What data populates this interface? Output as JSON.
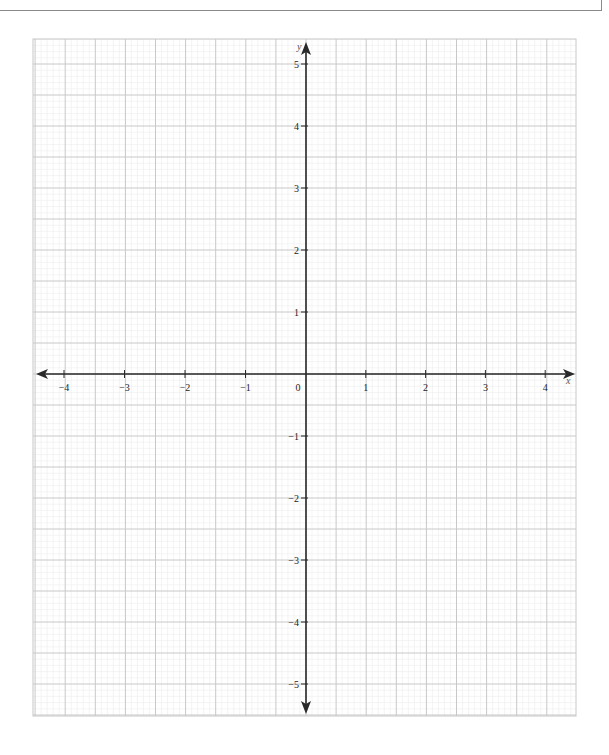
{
  "chart_data": {
    "type": "scatter",
    "title": "",
    "subtitle": "",
    "xlabel": "x",
    "ylabel": "y",
    "xlim": [
      -4.55,
      4.5
    ],
    "ylim": [
      -5.5,
      5.55
    ],
    "x_ticks": [
      -4,
      -3,
      -2,
      -1,
      0,
      1,
      2,
      3,
      4
    ],
    "x_tick_labels": [
      "−4",
      "−3",
      "−2",
      "−1",
      "0",
      "1",
      "2",
      "3",
      "4"
    ],
    "y_ticks": [
      5,
      4,
      3,
      2,
      1,
      -1,
      -2,
      -3,
      -4,
      -5
    ],
    "y_tick_labels": [
      "5",
      "4",
      "3",
      "2",
      "1",
      "−1",
      "−2",
      "−3",
      "−4",
      "−5"
    ],
    "origin_label": "0",
    "grid": {
      "on": true,
      "major_step": 0.5,
      "minor_step": 0.1
    },
    "series": [],
    "legend": null,
    "axes_arrows": {
      "x": "both",
      "y": "both"
    }
  },
  "colors": {
    "axis": "#2a2a2a",
    "major_grid": "#c8c8c8",
    "minor_grid": "#ececec",
    "border": "#8a8a8a",
    "label": "#222222"
  }
}
